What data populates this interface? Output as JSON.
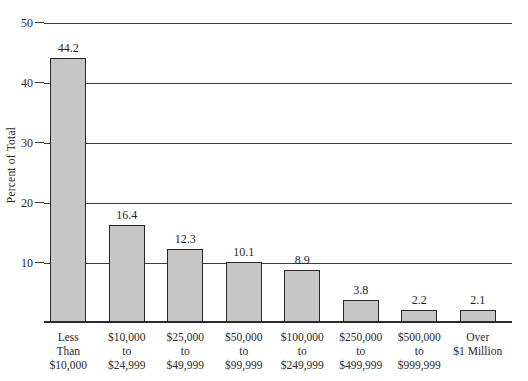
{
  "chart_data": {
    "type": "bar",
    "title": "",
    "xlabel": "",
    "ylabel": "Percent of Total",
    "ylim": [
      0,
      50
    ],
    "yticks": [
      10,
      20,
      30,
      40,
      50
    ],
    "ytick_labels": [
      "10",
      "20",
      "30",
      "40",
      "50"
    ],
    "grid": true,
    "legend": "none",
    "categories": [
      "Less Than $10,000",
      "$10,000 to $24,999",
      "$25,000 to $49,999",
      "$50,000 to $99,999",
      "$100,000 to $249,999",
      "$250,000 to $499,999",
      "$500,000 to $999,999",
      "Over $1 Million"
    ],
    "category_lines": [
      [
        "Less",
        "Than",
        "$10,000"
      ],
      [
        "$10,000",
        "to",
        "$24,999"
      ],
      [
        "$25,000",
        "to",
        "$49,999"
      ],
      [
        "$50,000",
        "to",
        "$99,999"
      ],
      [
        "$100,000",
        "to",
        "$249,999"
      ],
      [
        "$250,000",
        "to",
        "$499,999"
      ],
      [
        "$500,000",
        "to",
        "$999,999"
      ],
      [
        "Over",
        "$1 Million",
        ""
      ]
    ],
    "values": [
      44.2,
      16.4,
      12.3,
      10.1,
      8.9,
      3.8,
      2.2,
      2.1
    ],
    "value_labels": [
      "44.2",
      "16.4",
      "12.3",
      "10.1",
      "8.9",
      "3.8",
      "2.2",
      "2.1"
    ],
    "colors": {
      "bar_fill": "#c6c6c6",
      "bar_border": "#262626",
      "gridline": "#3a3a3a",
      "axis": "#2b2b2b",
      "text": "#2a2a2a"
    }
  }
}
